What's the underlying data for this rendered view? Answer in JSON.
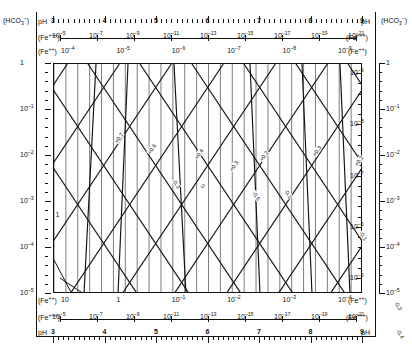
{
  "chart_data": {
    "type": "line",
    "xlabel": "pH",
    "ylabel": "(HCO3-)",
    "xlim": [
      3,
      9
    ],
    "ylim": [
      -5,
      0
    ],
    "grid": true,
    "legend": "none",
    "x_axes": [
      {
        "name": "ph-top",
        "label_left": "pH",
        "label_right": "pH",
        "ticks": [
          "3",
          "4",
          "5",
          "6",
          "7",
          "8",
          "9"
        ],
        "minor_per_interval": 10
      },
      {
        "name": "fe3-top",
        "label_left": "(Fe+++)",
        "label_right": "(Fe+++)",
        "ticks": [
          "10-5",
          "10-7",
          "10-9",
          "10-11",
          "10-13",
          "10-15",
          "10-17",
          "10-19",
          "10-21"
        ]
      },
      {
        "name": "fe2-top",
        "label_left": "(Fe++)",
        "label_right": "(Fe++)",
        "ticks": [
          "10-4",
          "10-5",
          "10-6",
          "10-7",
          "10-8",
          "10-9"
        ]
      },
      {
        "name": "fe2-bottom",
        "label_left": "(Fe++)",
        "label_right": "(Fe++)",
        "ticks": [
          "101",
          "1",
          "10-1",
          "10-2",
          "10-3",
          "10-4"
        ]
      },
      {
        "name": "fe3-bottom",
        "label_left": "(Fe+++)",
        "label_right": "(Fe+++)",
        "ticks": [
          "10-5",
          "10-7",
          "10-9",
          "10-11",
          "10-13",
          "10-15",
          "10-17",
          "10-19",
          "10-21"
        ]
      },
      {
        "name": "ph-bottom",
        "label_left": "pH",
        "label_right": "pH",
        "ticks": [
          "3",
          "4",
          "5",
          "6",
          "7",
          "8",
          "9"
        ],
        "minor_per_interval": 10
      }
    ],
    "y_axes": [
      {
        "name": "hco3-left",
        "corner_top": "(Fe+++)",
        "corner_bottom": "(Fe++)",
        "ticks": [
          "1",
          "10-1",
          "10-2",
          "10-3",
          "10-4",
          "10-5"
        ]
      },
      {
        "name": "inner-right",
        "ticks": [
          "10-9",
          "10-8",
          "10-7",
          "10-6",
          "10-5"
        ]
      },
      {
        "name": "hco3-right",
        "ticks": [
          "1",
          "10-1",
          "10-2",
          "10-3",
          "10-4",
          "10-5"
        ]
      }
    ],
    "corner_labels": {
      "top_left": "(HCO3-)",
      "top_right": "(HCO3-)",
      "top_inner_left": "(Fe+++)",
      "top_inner_right": "(Fe+++)",
      "bottom_inner_left": "(Fe++)",
      "bottom_inner_right": "(Fe++)"
    },
    "eh_labels": [
      "+0.7",
      "+0.6",
      "+0.4",
      "+0.3",
      "+0.2",
      "+0.1",
      "0",
      "-0.1",
      "-0.2",
      "-0.3",
      "-0.4",
      "-0.5"
    ],
    "inner_marker": "1",
    "series": [
      {
        "name": "vertical-grid",
        "count": 26,
        "orientation": "vertical"
      },
      {
        "name": "diagonal-up",
        "count": 11,
        "orientation": "rising"
      },
      {
        "name": "diagonal-down",
        "count": 11,
        "orientation": "falling"
      },
      {
        "name": "steep-lines",
        "count": 6,
        "orientation": "steep"
      }
    ],
    "colors": {
      "line": "#111111",
      "background": "#ffffff"
    }
  },
  "axis_text": {
    "hco3": "(HCO<sub>3</sub><sup>-</sup>)",
    "ph": "pH",
    "fe3": "(Fe<sup>+++</sup>)",
    "fe2": "(Fe<sup>++</sup>)"
  }
}
